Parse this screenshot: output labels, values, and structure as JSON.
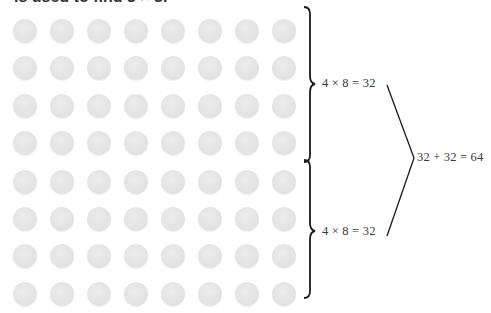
{
  "caption": "is used to find 8 × 8.",
  "grid": {
    "rows": 8,
    "cols": 8,
    "dot_color": "#e4e4e4",
    "col_centers": [
      25,
      62,
      99,
      136,
      173,
      210,
      247,
      284
    ],
    "row_centers": [
      31,
      68,
      106,
      143,
      182,
      219,
      256,
      294
    ],
    "dot_diameter": 24
  },
  "groups": [
    {
      "label": "4 × 8 = 32",
      "rows": 4,
      "cols": 8,
      "product": 32
    },
    {
      "label": "4 × 8 = 32",
      "rows": 4,
      "cols": 8,
      "product": 32
    }
  ],
  "total": {
    "label": "32 + 32 = 64",
    "value": 64
  },
  "colors": {
    "brace": "#1a1a1a",
    "text": "#3a3a3a",
    "dot": "#e4e4e4"
  }
}
